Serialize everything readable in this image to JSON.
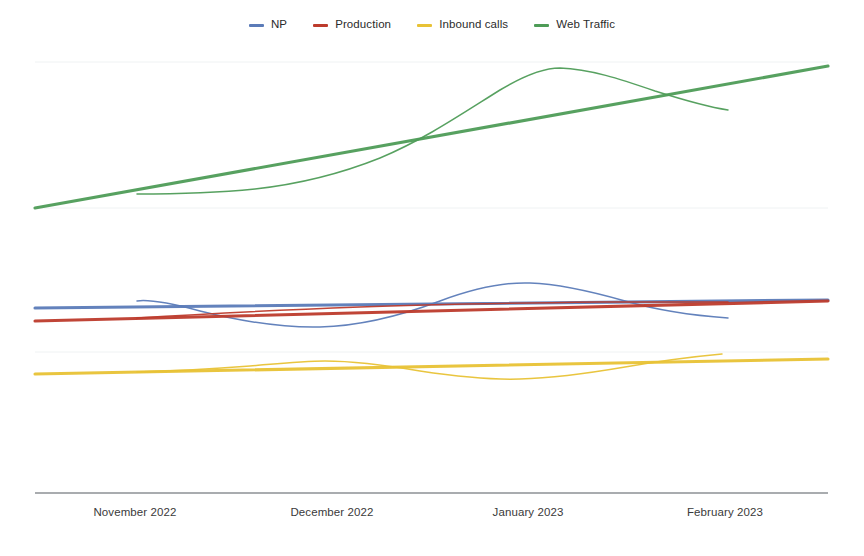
{
  "chart_data": {
    "type": "line",
    "title": "",
    "subtitle": "",
    "xlabel": "",
    "ylabel": "",
    "grid": true,
    "legend_position": "top-center",
    "axis": {
      "x_range_px": [
        35,
        828
      ],
      "y_baseline_px": 493,
      "gridlines_px": [
        62,
        208,
        352
      ],
      "y_axis_labels_shown": false
    },
    "categories": [
      "November 2022",
      "December 2022",
      "January 2023",
      "February 2023"
    ],
    "category_x_px": [
      135,
      332,
      528,
      725
    ],
    "colors": {
      "np": "#5b7bb8",
      "production": "#bd3b2c",
      "inbound_calls": "#e8c235",
      "web_traffic": "#4e9c57",
      "gridline": "#e9ecef",
      "axis": "#555a60",
      "background": "#ffffff",
      "text": "#2b2b2b"
    },
    "series": [
      {
        "name": "NP",
        "key": "np",
        "color": "#5b7bb8",
        "trend_path": "M35,308 L828,300",
        "data_path": "M137,301 C150,299 170,303 200,311 C240,321 280,328 320,327 C360,326 400,316 440,301 C475,288 505,282 530,283 C560,284 590,291 625,301 C660,311 700,316 728,318",
        "trend_values": [
          308,
          300
        ],
        "data_points_px": [
          [
            137,
            301
          ],
          [
            200,
            311
          ],
          [
            260,
            321
          ],
          [
            320,
            327
          ],
          [
            380,
            317
          ],
          [
            440,
            301
          ],
          [
            480,
            288
          ],
          [
            530,
            283
          ],
          [
            580,
            288
          ],
          [
            625,
            301
          ],
          [
            680,
            312
          ],
          [
            728,
            318
          ]
        ]
      },
      {
        "name": "Production",
        "key": "production",
        "color": "#bd3b2c",
        "trend_path": "M35,321 L828,301",
        "data_path": "M137,318 C200,314 280,310 360,307 C440,304 520,303 600,302 C660,302 700,302 728,302",
        "trend_values": [
          321,
          301
        ],
        "data_points_px": [
          [
            137,
            318
          ],
          [
            240,
            312
          ],
          [
            360,
            307
          ],
          [
            480,
            304
          ],
          [
            600,
            302
          ],
          [
            728,
            302
          ]
        ]
      },
      {
        "name": "Inbound calls",
        "key": "inbound_calls",
        "color": "#e8c235",
        "trend_path": "M35,374 L828,359",
        "data_path": "M137,372 C170,371 210,369 250,366 C285,363 305,361 325,361 C355,361 385,365 420,371 C460,377 490,380 520,379 C555,378 590,373 625,367 C660,361 700,356 722,354",
        "trend_values": [
          374,
          359
        ],
        "data_points_px": [
          [
            137,
            372
          ],
          [
            200,
            369
          ],
          [
            250,
            366
          ],
          [
            325,
            361
          ],
          [
            380,
            366
          ],
          [
            420,
            371
          ],
          [
            470,
            377
          ],
          [
            520,
            379
          ],
          [
            580,
            375
          ],
          [
            625,
            367
          ],
          [
            680,
            359
          ],
          [
            722,
            354
          ]
        ]
      },
      {
        "name": "Web Traffic",
        "key": "web_traffic",
        "color": "#4e9c57",
        "trend_path": "M35,208 L828,66",
        "data_path": "M137,194 C175,194 215,193 255,189 C300,184 340,174 380,158 C425,139 460,115 500,90 C525,75 545,68 560,68 C590,69 620,79 655,91 C690,102 715,108 728,110",
        "trend_values": [
          208,
          66
        ],
        "data_points_px": [
          [
            137,
            194
          ],
          [
            200,
            193
          ],
          [
            255,
            189
          ],
          [
            320,
            181
          ],
          [
            380,
            158
          ],
          [
            440,
            128
          ],
          [
            500,
            90
          ],
          [
            545,
            69
          ],
          [
            560,
            68
          ],
          [
            620,
            79
          ],
          [
            680,
            97
          ],
          [
            728,
            110
          ]
        ]
      }
    ]
  },
  "legend": {
    "items": [
      {
        "label": "NP",
        "color": "#5b7bb8"
      },
      {
        "label": "Production",
        "color": "#bd3b2c"
      },
      {
        "label": "Inbound calls",
        "color": "#e8c235"
      },
      {
        "label": "Web Traffic",
        "color": "#4e9c57"
      }
    ]
  },
  "xaxis": {
    "ticks": [
      {
        "label": "November 2022",
        "x": 135
      },
      {
        "label": "December 2022",
        "x": 332
      },
      {
        "label": "January 2023",
        "x": 528
      },
      {
        "label": "February 2023",
        "x": 725
      }
    ]
  }
}
